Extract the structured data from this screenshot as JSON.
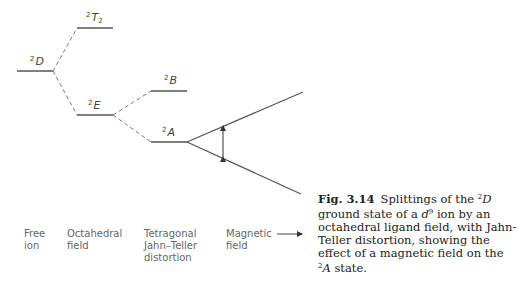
{
  "levels": {
    "free_ion": {
      "sup": "2",
      "term": "D",
      "sub": ""
    },
    "oct_upper": {
      "sup": "2",
      "term": "T",
      "sub": "2"
    },
    "oct_lower": {
      "sup": "2",
      "term": "E",
      "sub": ""
    },
    "tet_upper": {
      "sup": "2",
      "term": "B",
      "sub": ""
    },
    "tet_lower": {
      "sup": "2",
      "term": "A",
      "sub": ""
    }
  },
  "columns": [
    {
      "label": "Free\nion"
    },
    {
      "label": "Octahedral\nfield"
    },
    {
      "label": "Tetragonal\nJahn–Teller\ndistortion"
    },
    {
      "label": "Magnetic\nfield"
    }
  ],
  "caption": {
    "fig_no": "Fig. 3.14",
    "text_1": "Splittings of the ",
    "sup_1": "2",
    "term_1": "D",
    "text_2": " ground state of a ",
    "d": "d",
    "sup_d": "9",
    "text_3": " ion by an octahedral ligand field, with Jahn-Teller distortion, showing the effect of a magnetic field on the ",
    "sup_2": "2",
    "term_2": "A",
    "text_4": " state."
  },
  "colors": {
    "line": "#555555",
    "dashed": "#777777",
    "text": "#222222"
  }
}
